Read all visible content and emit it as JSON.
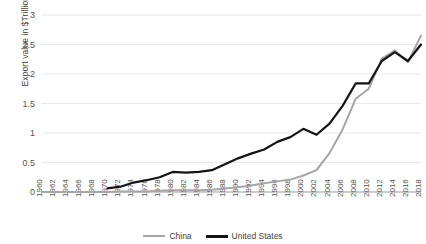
{
  "chart_data": {
    "type": "line",
    "title": "",
    "xlabel": "",
    "ylabel": "Export value in $Trillions",
    "ylim": [
      0,
      3
    ],
    "yticks": [
      0,
      0.5,
      1,
      1.5,
      2,
      2.5,
      3
    ],
    "ytick_labels": [
      "0",
      "0.5",
      "1",
      "1.5",
      "2",
      "2.5",
      "3"
    ],
    "grid": true,
    "legend_position": "bottom",
    "x": [
      1960,
      1962,
      1964,
      1966,
      1968,
      1970,
      1972,
      1974,
      1976,
      1978,
      1980,
      1982,
      1984,
      1986,
      1988,
      1990,
      1992,
      1994,
      1996,
      1998,
      2000,
      2002,
      2004,
      2006,
      2008,
      2010,
      2012,
      2014,
      2016,
      2018
    ],
    "xtick_labels": [
      "1960",
      "1962",
      "1964",
      "1966",
      "1968",
      "1970",
      "1972",
      "1974",
      "1976",
      "1978",
      "1980",
      "1982",
      "1984",
      "1986",
      "1988",
      "1990",
      "1992",
      "1994",
      "1996",
      "1998",
      "2000",
      "2002",
      "2004",
      "2006",
      "2008",
      "2010",
      "2012",
      "2014",
      "2016",
      "2018"
    ],
    "series": [
      {
        "name": "China",
        "color": "#a6a6a6",
        "width": 2.0,
        "x": [
          1960,
          1962,
          1964,
          1966,
          1968,
          1970,
          1972,
          1974,
          1976,
          1978,
          1980,
          1982,
          1984,
          1986,
          1988,
          1990,
          1992,
          1994,
          1996,
          1998,
          2000,
          2002,
          2004,
          2006,
          2008,
          2010,
          2012,
          2014,
          2016,
          2018
        ],
        "values": [
          0.0,
          0.0,
          0.0,
          0.0,
          0.0,
          0.0,
          0.01,
          0.01,
          0.01,
          0.02,
          0.03,
          0.03,
          0.03,
          0.04,
          0.06,
          0.08,
          0.11,
          0.15,
          0.18,
          0.21,
          0.28,
          0.37,
          0.66,
          1.06,
          1.58,
          1.75,
          2.26,
          2.4,
          2.2,
          2.65
        ]
      },
      {
        "name": "United States",
        "color": "#141414",
        "width": 2.2,
        "x": [
          1970,
          1972,
          1974,
          1976,
          1978,
          1980,
          1982,
          1984,
          1986,
          1988,
          1990,
          1992,
          1994,
          1996,
          1998,
          2000,
          2002,
          2004,
          2006,
          2008,
          2010,
          2012,
          2014,
          2016,
          2018
        ],
        "values": [
          0.06,
          0.09,
          0.16,
          0.2,
          0.25,
          0.34,
          0.33,
          0.34,
          0.37,
          0.47,
          0.57,
          0.65,
          0.72,
          0.85,
          0.93,
          1.07,
          0.97,
          1.16,
          1.46,
          1.84,
          1.84,
          2.22,
          2.37,
          2.22,
          2.5
        ]
      }
    ],
    "crossovers": [
      {
        "year": 2007,
        "note": "China export value overtakes a flat segment of US growth"
      }
    ]
  },
  "legend": {
    "items": [
      {
        "label": "China",
        "color": "#a6a6a6",
        "width": 2
      },
      {
        "label": "United States",
        "color": "#141414",
        "width": 3
      }
    ]
  }
}
